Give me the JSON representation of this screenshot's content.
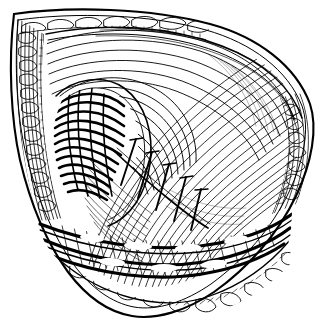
{
  "figure": {
    "kind": "line-art-illustration",
    "style": "pen-and-ink hatching / engraving",
    "caption": "",
    "width": 323,
    "height": 329,
    "background_color": "#ffffff",
    "ink_color": "#000000",
    "has_text_labels": false,
    "has_leader_lines": false
  },
  "palette": {
    "background": "#ffffff",
    "ink": "#000000",
    "mid_tone": "#3a3a3a"
  },
  "regions": [
    {
      "id": "wound-outline",
      "name": "leaf-shaped wound aperture",
      "description": "almond / leaf shaped retracted opening spanning the frame",
      "tone": "outline"
    },
    {
      "id": "skin-fat-border",
      "name": "subcutaneous fat margin",
      "description": "cobblestone lobular adipose pattern along upper, left and lower rims",
      "tone": "light"
    },
    {
      "id": "muscle-fan",
      "name": "radiating muscle fiber sheet",
      "description": "long curved parallel fibers fanning from upper-right toward centre",
      "tone": "light-to-mid"
    },
    {
      "id": "deep-pocket",
      "name": "dark recessed pocket",
      "description": "dense black convergence of fibers at centre-left",
      "tone": "dark"
    },
    {
      "id": "suture-line",
      "name": "suture / staple row",
      "description": "row of short transverse stitch marks crossing a diagonal closure line",
      "tone": "outline"
    },
    {
      "id": "vessel-band",
      "name": "vascular / fascial band",
      "description": "dense cross-hatched cord-like structures across the lower third",
      "tone": "dark"
    },
    {
      "id": "left-wall",
      "name": "retracted left wall",
      "description": "vertically striated retracted tissue flap on the left margin",
      "tone": "mid"
    },
    {
      "id": "right-wall",
      "name": "retracted right wall",
      "description": "narrow striated margin with lobular fat along the right edge",
      "tone": "mid"
    }
  ],
  "annotations": {
    "suture_count": 5,
    "suture_description": "five transverse stitch bars along an oblique closure line"
  }
}
